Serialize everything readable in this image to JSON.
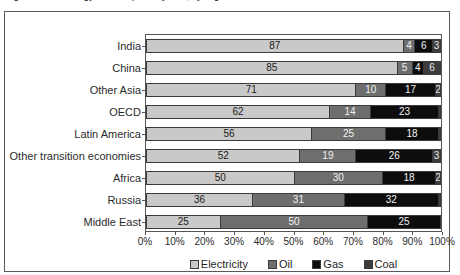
{
  "figure": {
    "title": "Figure: Final energy consumption by fuel, by region",
    "frame_color": "#5a5a5a"
  },
  "legend": {
    "position": "bottom-center",
    "items": [
      {
        "label": "Electricity",
        "color": "#c9c9c9",
        "key": "electricity"
      },
      {
        "label": "Oil",
        "color": "#6e6e6e",
        "key": "oil"
      },
      {
        "label": "Gas",
        "color": "#0d0d0d",
        "key": "gas"
      },
      {
        "label": "Coal",
        "color": "#3d3d3d",
        "key": "coal"
      }
    ]
  },
  "chart_data": {
    "type": "bar",
    "orientation": "horizontal",
    "stacked": true,
    "stack_total": 100,
    "title": "",
    "xlabel": "",
    "ylabel": "",
    "xlim": [
      0,
      100
    ],
    "grid": false,
    "legend_position": "bottom-center",
    "tick_labels": [
      "0%",
      "10%",
      "20%",
      "30%",
      "40%",
      "50%",
      "60%",
      "70%",
      "80%",
      "90%",
      "100%"
    ],
    "tick_values": [
      0,
      10,
      20,
      30,
      40,
      50,
      60,
      70,
      80,
      90,
      100
    ],
    "categories": [
      "India",
      "China",
      "Other Asia",
      "OECD",
      "Latin America",
      "Other transition economies",
      "Africa",
      "Russia",
      "Middle East"
    ],
    "series": [
      {
        "name": "Electricity",
        "color": "#c9c9c9",
        "values": [
          87,
          85,
          71,
          62,
          56,
          52,
          50,
          36,
          25
        ]
      },
      {
        "name": "Oil",
        "color": "#6e6e6e",
        "values": [
          4,
          5,
          10,
          14,
          25,
          19,
          30,
          31,
          50
        ]
      },
      {
        "name": "Gas",
        "color": "#0d0d0d",
        "values": [
          6,
          4,
          17,
          23,
          18,
          26,
          18,
          32,
          25
        ]
      },
      {
        "name": "Coal",
        "color": "#3d3d3d",
        "values": [
          3,
          6,
          2,
          1,
          1,
          3,
          2,
          1,
          0
        ]
      }
    ],
    "rows": [
      {
        "category": "India",
        "electricity": 87,
        "oil": 4,
        "gas": 6,
        "coal": 3
      },
      {
        "category": "China",
        "electricity": 85,
        "oil": 5,
        "gas": 4,
        "coal": 6
      },
      {
        "category": "Other Asia",
        "electricity": 71,
        "oil": 10,
        "gas": 17,
        "coal": 2
      },
      {
        "category": "OECD",
        "electricity": 62,
        "oil": 14,
        "gas": 23,
        "coal": 1
      },
      {
        "category": "Latin America",
        "electricity": 56,
        "oil": 25,
        "gas": 18,
        "coal": 1
      },
      {
        "category": "Other transition economies",
        "electricity": 52,
        "oil": 19,
        "gas": 26,
        "coal": 3
      },
      {
        "category": "Africa",
        "electricity": 50,
        "oil": 30,
        "gas": 18,
        "coal": 2
      },
      {
        "category": "Russia",
        "electricity": 36,
        "oil": 31,
        "gas": 32,
        "coal": 1
      },
      {
        "category": "Middle East",
        "electricity": 25,
        "oil": 50,
        "gas": 25,
        "coal": 0
      }
    ]
  }
}
